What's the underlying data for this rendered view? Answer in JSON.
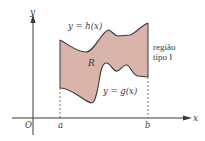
{
  "diagram": {
    "type": "type-I region between two curves",
    "axes": {
      "x_label": "x",
      "y_label": "y",
      "origin_label": "O"
    },
    "bounds": {
      "a_label": "a",
      "b_label": "b"
    },
    "curves": {
      "upper_label": "y = h(x)",
      "lower_label": "y = g(x)"
    },
    "region": {
      "label": "R",
      "caption_line1": "região",
      "caption_line2": "tipo I",
      "fill_color": "#d8b4aa",
      "stroke_color": "#3a3a3a"
    }
  }
}
